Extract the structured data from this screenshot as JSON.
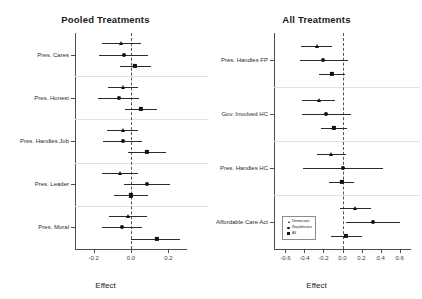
{
  "chart_data": [
    {
      "type": "scatter",
      "title": "Pooled Treatments",
      "xlabel": "Effect",
      "ylabel": "",
      "xlim": [
        -0.3,
        0.3
      ],
      "xticks": [
        -0.2,
        0.0,
        0.2
      ],
      "xtick_labels": [
        "-0.2",
        "0.0",
        "0.2"
      ],
      "grid": false,
      "reference_line": 0.0,
      "categories": [
        "Pres. Cares",
        "Pres. Honest",
        "Pres. Handles Job",
        "Pres. Leader",
        "Pres. Moral"
      ],
      "series": [
        {
          "name": "Democrats",
          "marker": "triangle",
          "points": [
            {
              "category": "Pres. Cares",
              "estimate": -0.055,
              "low": -0.155,
              "high": 0.055
            },
            {
              "category": "Pres. Honest",
              "estimate": -0.045,
              "low": -0.125,
              "high": 0.04
            },
            {
              "category": "Pres. Handles Job",
              "estimate": -0.045,
              "low": -0.13,
              "high": 0.035
            },
            {
              "category": "Pres. Leader",
              "estimate": -0.06,
              "low": -0.155,
              "high": 0.04
            },
            {
              "category": "Pres. Moral",
              "estimate": -0.015,
              "low": -0.12,
              "high": 0.085
            }
          ]
        },
        {
          "name": "Republicans",
          "marker": "circle",
          "points": [
            {
              "category": "Pres. Cares",
              "estimate": -0.04,
              "low": -0.17,
              "high": 0.09
            },
            {
              "category": "Pres. Honest",
              "estimate": -0.065,
              "low": -0.175,
              "high": 0.045
            },
            {
              "category": "Pres. Handles Job",
              "estimate": -0.045,
              "low": -0.15,
              "high": 0.06
            },
            {
              "category": "Pres. Leader",
              "estimate": 0.085,
              "low": -0.04,
              "high": 0.21
            },
            {
              "category": "Pres. Moral",
              "estimate": -0.05,
              "low": -0.155,
              "high": 0.06
            }
          ]
        },
        {
          "name": "All",
          "marker": "square",
          "points": [
            {
              "category": "Pres. Cares",
              "estimate": 0.02,
              "low": -0.06,
              "high": 0.105
            },
            {
              "category": "Pres. Honest",
              "estimate": 0.055,
              "low": -0.03,
              "high": 0.14
            },
            {
              "category": "Pres. Handles Job",
              "estimate": 0.085,
              "low": -0.015,
              "high": 0.185
            },
            {
              "category": "Pres. Leader",
              "estimate": 0.0,
              "low": -0.09,
              "high": 0.09
            },
            {
              "category": "Pres. Moral",
              "estimate": 0.14,
              "low": 0.0,
              "high": 0.265
            }
          ]
        }
      ]
    },
    {
      "type": "scatter",
      "title": "All Treatments",
      "xlabel": "Effect",
      "ylabel": "",
      "xlim": [
        -0.72,
        0.72
      ],
      "xticks": [
        -0.6,
        -0.4,
        -0.2,
        0.0,
        0.2,
        0.4,
        0.6
      ],
      "xtick_labels": [
        "-0.6",
        "-0.4",
        "-0.2",
        "0.0",
        "0.2",
        "0.4",
        "0.6"
      ],
      "grid": false,
      "reference_line": 0.0,
      "categories": [
        "Pres. Handles FP",
        "Gov. Involved HC",
        "Pres. Handles HC",
        "Affordable Care Act"
      ],
      "series": [
        {
          "name": "Democrats",
          "marker": "triangle",
          "points": [
            {
              "category": "Pres. Handles FP",
              "estimate": -0.27,
              "low": -0.44,
              "high": -0.11
            },
            {
              "category": "Gov. Involved HC",
              "estimate": -0.25,
              "low": -0.43,
              "high": -0.08
            },
            {
              "category": "Pres. Handles HC",
              "estimate": -0.12,
              "low": -0.27,
              "high": 0.04
            },
            {
              "category": "Affordable Care Act",
              "estimate": 0.13,
              "low": -0.03,
              "high": 0.3
            }
          ]
        },
        {
          "name": "Republicans",
          "marker": "circle",
          "points": [
            {
              "category": "Pres. Handles FP",
              "estimate": -0.2,
              "low": -0.45,
              "high": 0.06
            },
            {
              "category": "Gov. Involved HC",
              "estimate": -0.17,
              "low": -0.43,
              "high": 0.09
            },
            {
              "category": "Pres. Handles HC",
              "estimate": 0.0,
              "low": -0.42,
              "high": 0.43
            },
            {
              "category": "Affordable Care Act",
              "estimate": 0.32,
              "low": 0.04,
              "high": 0.6
            }
          ]
        },
        {
          "name": "All",
          "marker": "square",
          "points": [
            {
              "category": "Pres. Handles FP",
              "estimate": -0.11,
              "low": -0.25,
              "high": 0.03
            },
            {
              "category": "Gov. Involved HC",
              "estimate": -0.09,
              "low": -0.23,
              "high": 0.05
            },
            {
              "category": "Pres. Handles HC",
              "estimate": -0.01,
              "low": -0.14,
              "high": 0.12
            },
            {
              "category": "Affordable Care Act",
              "estimate": 0.04,
              "low": -0.12,
              "high": 0.2
            }
          ]
        }
      ],
      "legend": {
        "position": "bottom-left",
        "entries": [
          "Democrats",
          "Republicans",
          "All"
        ]
      }
    }
  ]
}
